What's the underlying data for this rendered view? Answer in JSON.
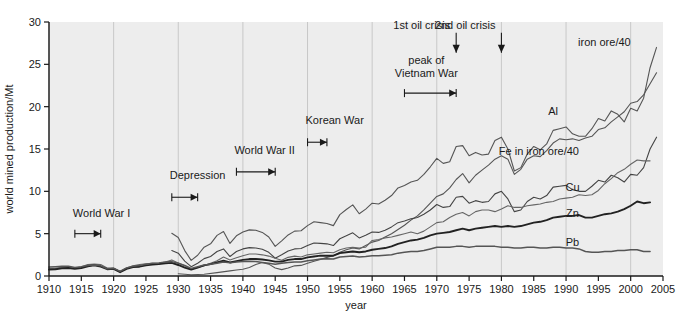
{
  "chart_data": {
    "type": "line",
    "title": "",
    "xlabel": "year",
    "ylabel": "world mined production/Mt",
    "xlim": [
      1910,
      2005
    ],
    "ylim": [
      0,
      30
    ],
    "xticks": [
      1910,
      1915,
      1920,
      1925,
      1930,
      1935,
      1940,
      1945,
      1950,
      1955,
      1960,
      1965,
      1970,
      1975,
      1980,
      1985,
      1990,
      1995,
      2000,
      2005
    ],
    "yticks": [
      0,
      5,
      10,
      15,
      20,
      25,
      30
    ],
    "grid": "vertical gridlines every 10 years",
    "legend_position": "inline end-of-line labels",
    "series": [
      {
        "name": "iron ore/40",
        "label": "iron ore/40",
        "label_x": 2000,
        "label_y": 27.2,
        "color": "#555555",
        "x": [
          1910,
          1913,
          1915,
          1918,
          1920,
          1921,
          1923,
          1925,
          1927,
          1929,
          1930,
          1931,
          1932,
          1933,
          1935,
          1937,
          1938,
          1939,
          1940,
          1942,
          1944,
          1945,
          1946,
          1948,
          1950,
          1952,
          1954,
          1955,
          1957,
          1958,
          1960,
          1962,
          1964,
          1966,
          1968,
          1970,
          1971,
          1972,
          1973,
          1974,
          1975,
          1976,
          1977,
          1978,
          1979,
          1980,
          1981,
          1982,
          1983,
          1984,
          1985,
          1986,
          1987,
          1988,
          1989,
          1990,
          1991,
          1992,
          1993,
          1994,
          1995,
          1996,
          1997,
          1998,
          1999,
          2000,
          2001,
          2002,
          2003
        ],
        "y": [
          null,
          null,
          null,
          null,
          null,
          null,
          null,
          null,
          null,
          5.0,
          4.6,
          3.0,
          1.8,
          2.3,
          3.6,
          5.2,
          3.9,
          4.9,
          5.2,
          5.4,
          4.5,
          3.5,
          4.2,
          5.3,
          6.0,
          6.2,
          6.0,
          7.3,
          8.4,
          7.4,
          8.6,
          9.0,
          10.4,
          11.2,
          12.0,
          13.9,
          13.3,
          13.8,
          15.2,
          15.4,
          14.2,
          15.4,
          15.4,
          14.5,
          16.0,
          16.5,
          15.0,
          12.5,
          13.0,
          14.6,
          15.4,
          15.0,
          16.0,
          17.2,
          17.3,
          17.6,
          16.8,
          16.6,
          16.5,
          17.5,
          18.6,
          18.4,
          19.5,
          19.0,
          18.3,
          19.8,
          19.6,
          21.0,
          24.5
        ]
      },
      {
        "name": "Al",
        "label": "Al",
        "label_x": 1988,
        "label_y": 19.0,
        "color": "#555555",
        "x": [
          1910,
          1920,
          1930,
          1935,
          1939,
          1941,
          1943,
          1945,
          1946,
          1948,
          1950,
          1952,
          1955,
          1958,
          1960,
          1962,
          1965,
          1968,
          1970,
          1972,
          1974,
          1975,
          1976,
          1978,
          1980,
          1982,
          1984,
          1986,
          1988,
          1990,
          1992,
          1994,
          1996,
          1998,
          2000,
          2002,
          2003
        ],
        "y": [
          null,
          null,
          null,
          null,
          null,
          null,
          null,
          null,
          null,
          null,
          null,
          null,
          null,
          null,
          null,
          null,
          null,
          null,
          null,
          null,
          null,
          null,
          null,
          null,
          null,
          null,
          null,
          null,
          null,
          null,
          null,
          null,
          null,
          null,
          null,
          null,
          null
        ]
      },
      {
        "name": "Fe in iron ore/40",
        "label": "Fe in iron ore/40",
        "label_x": 1992,
        "label_y": 14.3,
        "color": "#444444"
      },
      {
        "name": "Cu",
        "label": "Cu",
        "label_x": 1991,
        "label_y": 10.0,
        "color": "#666666"
      },
      {
        "name": "Zn",
        "label": "Zn",
        "label_x": 1991,
        "label_y": 7.0,
        "color": "#222222"
      },
      {
        "name": "Pb",
        "label": "Pb",
        "label_x": 1991,
        "label_y": 3.6,
        "color": "#555555"
      }
    ],
    "annotations": [
      {
        "id": "world-war-i",
        "text": "World War I",
        "type": "span-bracket",
        "x_start": 1914,
        "x_end": 1918,
        "label_y": 7.0,
        "bracket_y": 5.0
      },
      {
        "id": "depression",
        "text": "Depression",
        "type": "span-bracket",
        "x_start": 1929,
        "x_end": 1933,
        "label_y": 11.5,
        "bracket_y": 9.3
      },
      {
        "id": "world-war-ii",
        "text": "World War II",
        "type": "span-bracket",
        "x_start": 1939,
        "x_end": 1945,
        "label_y": 14.4,
        "bracket_y": 12.3
      },
      {
        "id": "korean-war",
        "text": "Korean War",
        "type": "span-bracket",
        "x_start": 1950,
        "x_end": 1953,
        "label_y": 17.9,
        "bracket_y": 15.8
      },
      {
        "id": "peak-of-vietnam-war",
        "text": "peak of\nVietnam War",
        "type": "span-bracket",
        "x_start": 1965,
        "x_end": 1973,
        "label_y": 25.0,
        "bracket_y": 21.6
      },
      {
        "id": "1st-oil-crisis",
        "text": "1st oil crisis",
        "type": "arrow-down",
        "x": 1973,
        "label_y": 29.2
      },
      {
        "id": "2nd-oil-crisis",
        "text": "2nd oil crisis",
        "type": "arrow-down",
        "x": 1980,
        "label_y": 29.2
      }
    ]
  },
  "axes": {
    "y_label": "world mined production/Mt",
    "x_label": "year",
    "y_tick_labels": [
      "0",
      "5",
      "10",
      "15",
      "20",
      "25",
      "30"
    ],
    "x_tick_labels": [
      "1910",
      "1915",
      "1920",
      "1925",
      "1930",
      "1935",
      "1940",
      "1945",
      "1950",
      "1955",
      "1960",
      "1965",
      "1970",
      "1975",
      "1980",
      "1985",
      "1990",
      "1995",
      "2000",
      "2005"
    ]
  },
  "style": {
    "plot_background": "#ededed",
    "page_background": "#ffffff",
    "axis_color": "#1a1a1a",
    "gridline_color": "#c8c8c8"
  }
}
